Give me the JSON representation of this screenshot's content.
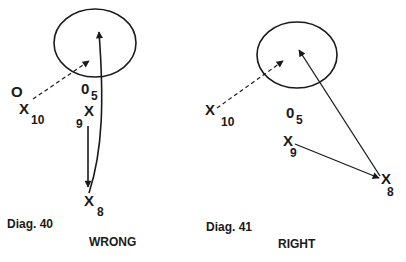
{
  "colors": {
    "ink": "#1a1a1a",
    "background": "#ffffff"
  },
  "diagrams": [
    {
      "caption": "Diag. 40",
      "verdict": "WRONG",
      "labels": {
        "opponent_marker": "O",
        "p10_mark": "X",
        "p10_num": "10",
        "p5_mark": "0",
        "p5_num": "5",
        "p9_mark": "X",
        "p9_num": "9",
        "p8_mark": "X",
        "p8_num": "8"
      }
    },
    {
      "caption": "Diag. 41",
      "verdict": "RIGHT",
      "labels": {
        "p10_mark": "X",
        "p10_num": "10",
        "p5_mark": "0",
        "p5_num": "5",
        "p9_mark": "X",
        "p9_num": "9",
        "p8_mark": "X",
        "p8_num": "8"
      }
    }
  ]
}
